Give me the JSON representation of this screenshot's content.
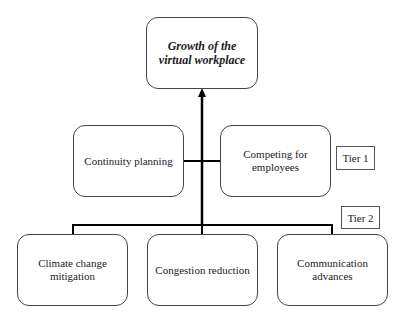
{
  "root": {
    "label": "Growth of the virtual workplace"
  },
  "tier1": {
    "tag": "Tier 1",
    "nodes": [
      {
        "label": "Continuity planning"
      },
      {
        "label": "Competing for employees"
      }
    ]
  },
  "tier2": {
    "tag": "Tier 2",
    "nodes": [
      {
        "label": "Climate change mitigation"
      },
      {
        "label": "Congestion reduction"
      },
      {
        "label": "Communication advances"
      }
    ]
  }
}
